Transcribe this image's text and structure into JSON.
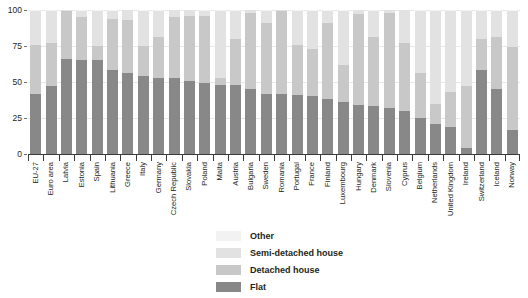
{
  "chart_data": {
    "type": "bar",
    "stacked": true,
    "title": "",
    "subtitle": "",
    "xlabel": "",
    "ylabel": "",
    "ylim": [
      0,
      100
    ],
    "yticks": [
      0,
      25,
      50,
      75,
      100
    ],
    "grid": true,
    "legend_position": "bottom-center",
    "legend": [
      "Other",
      "Semi-detached house",
      "Detached house",
      "Flat"
    ],
    "categories": [
      "EU-27",
      "Euro area",
      "Latvia",
      "Estonia",
      "Spain",
      "Lithuania",
      "Greece",
      "Italy",
      "Germany",
      "Czech Republic",
      "Slovakia",
      "Poland",
      "Malta",
      "Austria",
      "Bulgaria",
      "Sweden",
      "Romania",
      "Portugal",
      "France",
      "Finland",
      "Luxembourg",
      "Hungary",
      "Denmark",
      "Slovenia",
      "Cyprus",
      "Belgium",
      "Netherlands",
      "United Kingdom",
      "Ireland",
      "Switzerland",
      "Iceland",
      "Norway"
    ],
    "series": [
      {
        "name": "Flat",
        "color": "#888888",
        "values": [
          42,
          47,
          66,
          65,
          65,
          58,
          56,
          54,
          53,
          53,
          51,
          49,
          48,
          48,
          45,
          42,
          42,
          41,
          40,
          38,
          36,
          34,
          33,
          32,
          30,
          25,
          21,
          19,
          4,
          58,
          45,
          17
        ]
      },
      {
        "name": "Detached house",
        "color": "#c8c8c8",
        "values": [
          34,
          30,
          33,
          30,
          10,
          36,
          37,
          21,
          28,
          42,
          45,
          47,
          5,
          32,
          53,
          49,
          57,
          35,
          33,
          53,
          26,
          63,
          48,
          66,
          47,
          31,
          14,
          24,
          43,
          22,
          36,
          57
        ]
      },
      {
        "name": "Semi-detached house",
        "color": "#e2e2e2",
        "values": [
          23,
          22,
          1,
          4,
          24,
          5,
          7,
          24,
          18,
          5,
          4,
          3,
          46,
          19,
          2,
          8,
          1,
          23,
          26,
          8,
          37,
          3,
          18,
          2,
          23,
          43,
          64,
          56,
          52,
          19,
          18,
          25
        ]
      },
      {
        "name": "Other",
        "color": "#f2f2f2",
        "values": [
          1,
          1,
          0,
          1,
          1,
          1,
          0,
          1,
          1,
          0,
          0,
          1,
          1,
          1,
          0,
          1,
          0,
          1,
          1,
          1,
          1,
          0,
          1,
          0,
          0,
          1,
          1,
          1,
          1,
          1,
          1,
          1
        ]
      }
    ]
  }
}
